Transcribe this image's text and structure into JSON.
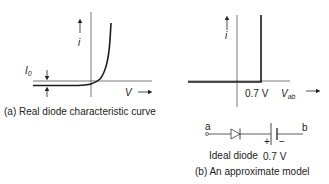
{
  "panel_a": {
    "caption": "(a) Real diode characteristic curve",
    "y_axis_label": "i",
    "x_axis_label": "V",
    "saturation_current_label": "I",
    "saturation_current_subscript": "0"
  },
  "panel_b": {
    "caption": "(b) An approximate model",
    "y_axis_label": "i",
    "x_axis_label": "V",
    "x_axis_subscript": "ab",
    "threshold_label": "0.7 V",
    "circuit": {
      "terminal_a": "a",
      "terminal_b": "b",
      "diode_label": "Ideal diode",
      "battery_label": "0.7 V",
      "battery_plus": "+",
      "battery_minus": "−"
    }
  },
  "colors": {
    "line": "#1a1a1a",
    "axis": "#444444",
    "background": "#ffffff"
  }
}
